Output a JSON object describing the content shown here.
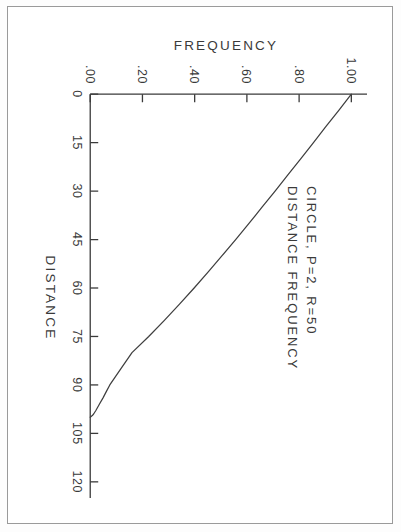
{
  "page": {
    "background_color": "#ffffff",
    "border_color": "#9a9a9a",
    "ink_color": "#3a3a3a"
  },
  "figure": {
    "rotation_degrees": 90,
    "title_line1": "CIRCLE,  P=2,  R=50",
    "title_line2": "DISTANCE FREQUENCY"
  },
  "chart_data": {
    "type": "line",
    "xlabel": "DISTANCE",
    "ylabel": "FREQUENCY",
    "xlim": [
      -5,
      125
    ],
    "ylim": [
      -0.02,
      1.06
    ],
    "xticks": [
      0,
      15,
      30,
      45,
      60,
      75,
      90,
      105,
      120
    ],
    "xtick_labels": [
      "0",
      "15",
      "30",
      "45",
      "60",
      "75",
      "90",
      "105",
      "120"
    ],
    "yticks": [
      0.0,
      0.2,
      0.4,
      0.6,
      0.8,
      1.0
    ],
    "ytick_labels": [
      ".00",
      ".20",
      ".40",
      ".60",
      ".80",
      "1.00"
    ],
    "grid": false,
    "legend": false,
    "series": [
      {
        "name": "distance frequency",
        "x": [
          0,
          5,
          10,
          15,
          20,
          25,
          30,
          35,
          40,
          45,
          50,
          55,
          60,
          65,
          70,
          75,
          80,
          85,
          90,
          92,
          94,
          96,
          97,
          98,
          99,
          99.5,
          100
        ],
        "y": [
          1.0,
          0.952,
          0.903,
          0.855,
          0.806,
          0.757,
          0.708,
          0.658,
          0.608,
          0.557,
          0.505,
          0.452,
          0.398,
          0.342,
          0.284,
          0.224,
          0.16,
          0.117,
          0.075,
          0.062,
          0.049,
          0.035,
          0.028,
          0.021,
          0.013,
          0.008,
          0.0
        ]
      }
    ]
  }
}
